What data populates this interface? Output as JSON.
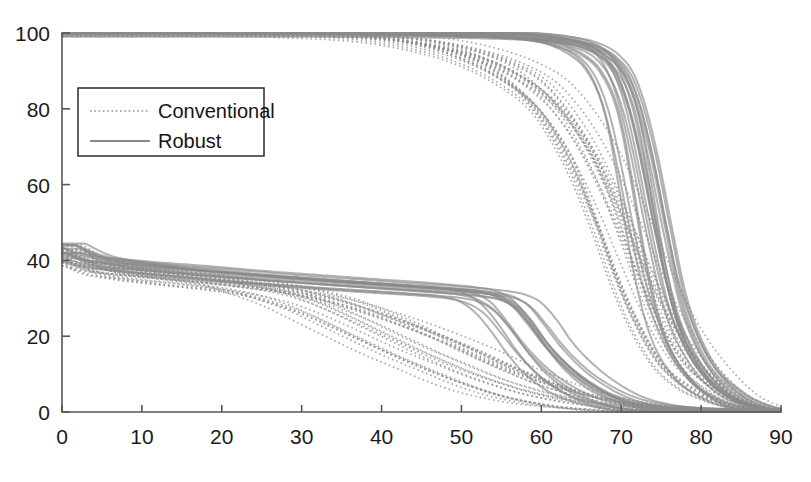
{
  "chart_data": {
    "type": "line",
    "title": "",
    "subtitle": "",
    "xlabel": "",
    "ylabel": "",
    "xlim": [
      0,
      90
    ],
    "ylim": [
      0,
      100
    ],
    "xticks": [
      0,
      10,
      20,
      30,
      40,
      50,
      60,
      70,
      80,
      90
    ],
    "yticks": [
      0,
      20,
      40,
      60,
      80,
      100
    ],
    "xticklabels": [
      "0",
      "10",
      "20",
      "30",
      "40",
      "50",
      "60",
      "70",
      "80",
      "90"
    ],
    "yticklabels": [
      "0",
      "20",
      "40",
      "60",
      "80",
      "100"
    ],
    "grid": false,
    "legend": {
      "position": "upper-left-inside",
      "entries": [
        {
          "label": "Conventional",
          "style": "dotted",
          "color": "#8d8d8d"
        },
        {
          "label": "Robust",
          "style": "solid",
          "color": "#8d8d8d"
        }
      ]
    },
    "series": [
      {
        "name": "Conventional",
        "style": "dotted",
        "color": "#909090",
        "family": "upper",
        "x": [
          0,
          20,
          30,
          35,
          40,
          45,
          50,
          55,
          60,
          62,
          65,
          68,
          70,
          72,
          75,
          78,
          82,
          86,
          90
        ],
        "values": [
          100,
          100,
          99.5,
          99,
          98,
          96,
          93,
          88,
          80,
          74,
          62,
          46,
          34,
          24,
          13,
          7,
          3,
          1,
          0
        ]
      },
      {
        "name": "Conventional",
        "style": "dotted",
        "color": "#909090",
        "family": "upper",
        "x": [
          0,
          20,
          30,
          35,
          40,
          45,
          50,
          55,
          58,
          62,
          65,
          68,
          70,
          73,
          76,
          80,
          84,
          88,
          90
        ],
        "values": [
          100,
          100,
          99.6,
          99.2,
          98.4,
          97,
          94.5,
          90,
          85,
          76,
          66,
          50,
          38,
          24,
          13,
          6,
          2,
          0.5,
          0
        ]
      },
      {
        "name": "Conventional",
        "style": "dotted",
        "color": "#909090",
        "family": "upper",
        "x": [
          0,
          20,
          32,
          38,
          43,
          48,
          52,
          56,
          60,
          64,
          67,
          70,
          72,
          75,
          78,
          82,
          86,
          90
        ],
        "values": [
          100,
          100,
          99.8,
          99,
          98,
          96,
          93,
          89,
          83,
          72,
          60,
          46,
          35,
          21,
          11,
          4,
          1,
          0
        ]
      },
      {
        "name": "Conventional",
        "style": "dotted",
        "color": "#909090",
        "family": "upper",
        "x": [
          0,
          22,
          34,
          40,
          46,
          50,
          54,
          58,
          62,
          66,
          69,
          72,
          75,
          78,
          82,
          86,
          90
        ],
        "values": [
          100,
          100,
          99.5,
          98.5,
          96.5,
          94.5,
          91,
          86,
          78,
          65,
          52,
          37,
          23,
          13,
          5,
          1.5,
          0
        ]
      },
      {
        "name": "Conventional",
        "style": "dotted",
        "color": "#909090",
        "family": "upper",
        "x": [
          0,
          24,
          36,
          42,
          48,
          53,
          57,
          61,
          65,
          68,
          71,
          74,
          77,
          81,
          85,
          90
        ],
        "values": [
          100,
          100,
          99.6,
          99,
          97.5,
          95,
          92,
          87,
          77,
          66,
          52,
          37,
          24,
          12,
          4,
          0
        ]
      },
      {
        "name": "Robust",
        "style": "solid",
        "color": "#8a8a8a",
        "family": "upper",
        "x": [
          0,
          25,
          40,
          50,
          56,
          60,
          63,
          66,
          68,
          70,
          71,
          72,
          74,
          76,
          79,
          83,
          87,
          90
        ],
        "values": [
          100,
          100,
          99.8,
          99.4,
          99,
          98.3,
          97,
          94,
          90,
          81,
          72,
          60,
          36,
          20,
          9,
          3,
          0.5,
          0
        ]
      },
      {
        "name": "Robust",
        "style": "solid",
        "color": "#8a8a8a",
        "family": "upper",
        "x": [
          0,
          25,
          40,
          50,
          57,
          61,
          64,
          67,
          69,
          70.5,
          72,
          73.5,
          75,
          78,
          81,
          85,
          90
        ],
        "values": [
          100,
          100,
          99.7,
          99.2,
          98.6,
          97.8,
          96.4,
          93,
          87,
          78,
          64,
          48,
          34,
          17,
          8,
          2,
          0
        ]
      },
      {
        "name": "Robust",
        "style": "solid",
        "color": "#8a8a8a",
        "family": "upper",
        "x": [
          0,
          26,
          42,
          52,
          58,
          62,
          65,
          67.5,
          69.5,
          71,
          72.5,
          74,
          76,
          79,
          83,
          87,
          90
        ],
        "values": [
          100,
          100,
          99.8,
          99.5,
          99,
          98,
          96.5,
          93.5,
          88,
          79,
          66,
          50,
          30,
          14,
          5,
          1,
          0
        ]
      },
      {
        "name": "Robust",
        "style": "solid",
        "color": "#8a8a8a",
        "family": "upper",
        "x": [
          0,
          27,
          44,
          54,
          60,
          64,
          66.5,
          68.5,
          70,
          71.5,
          73,
          74.5,
          77,
          80,
          84,
          88,
          90
        ],
        "values": [
          100,
          100,
          99.9,
          99.6,
          99.2,
          98.2,
          96.8,
          94,
          89,
          80,
          66,
          50,
          27,
          13,
          4,
          0.8,
          0
        ]
      },
      {
        "name": "Conventional",
        "style": "dotted",
        "color": "#909090",
        "family": "lower",
        "x": [
          0,
          2,
          5,
          10,
          15,
          20,
          24,
          28,
          32,
          36,
          40,
          44,
          48,
          52,
          56,
          60,
          65,
          70,
          75,
          80,
          90
        ],
        "values": [
          41,
          38,
          36.5,
          35,
          34,
          32.5,
          30,
          27,
          23,
          19,
          15,
          11.5,
          8,
          5,
          3,
          1.6,
          0.7,
          0.2,
          0,
          0,
          0
        ]
      },
      {
        "name": "Conventional",
        "style": "dotted",
        "color": "#909090",
        "family": "lower",
        "x": [
          0,
          2,
          6,
          12,
          18,
          24,
          28,
          32,
          36,
          40,
          44,
          48,
          52,
          56,
          60,
          64,
          68,
          72,
          78,
          85,
          90
        ],
        "values": [
          42,
          39,
          37,
          35.5,
          34,
          32,
          29.5,
          26,
          22,
          18,
          14,
          10.5,
          7.5,
          5,
          3.2,
          2,
          1,
          0.4,
          0,
          0,
          0
        ]
      },
      {
        "name": "Conventional",
        "style": "dotted",
        "color": "#909090",
        "family": "lower",
        "x": [
          0,
          3,
          8,
          14,
          20,
          26,
          30,
          34,
          38,
          42,
          46,
          50,
          54,
          58,
          62,
          66,
          70,
          75,
          82,
          90
        ],
        "values": [
          40.5,
          37.5,
          36,
          34.8,
          33.2,
          31,
          28.5,
          25,
          21,
          17,
          13.5,
          10,
          7,
          4.5,
          2.8,
          1.5,
          0.6,
          0.1,
          0,
          0
        ]
      },
      {
        "name": "Conventional",
        "style": "dotted",
        "color": "#909090",
        "family": "lower",
        "x": [
          0,
          3,
          9,
          16,
          22,
          28,
          34,
          38,
          42,
          46,
          50,
          54,
          58,
          62,
          66,
          70,
          74,
          80,
          86,
          90
        ],
        "values": [
          43,
          39.5,
          37,
          35.4,
          34,
          32,
          29,
          26,
          22.5,
          18.5,
          14.5,
          11,
          7.5,
          5,
          3,
          1.6,
          0.7,
          0.1,
          0,
          0
        ]
      },
      {
        "name": "Conventional",
        "style": "dotted",
        "color": "#909090",
        "family": "lower",
        "x": [
          0,
          4,
          10,
          18,
          25,
          31,
          36,
          41,
          46,
          50,
          54,
          58,
          62,
          66,
          70,
          74,
          78,
          84,
          90
        ],
        "values": [
          41.5,
          38,
          36.2,
          34.6,
          33,
          31,
          28,
          24.5,
          20.5,
          17,
          13,
          9.5,
          6.5,
          4,
          2.2,
          1.1,
          0.4,
          0,
          0
        ]
      },
      {
        "name": "Conventional",
        "style": "dotted",
        "color": "#909090",
        "family": "lower",
        "x": [
          0,
          4,
          12,
          20,
          27,
          33,
          38,
          43,
          48,
          52,
          56,
          60,
          64,
          68,
          72,
          76,
          82,
          90
        ],
        "values": [
          42.5,
          39,
          36.5,
          34.5,
          32.5,
          30,
          27,
          23.5,
          19.5,
          16,
          12,
          8.5,
          5.5,
          3.3,
          1.8,
          0.8,
          0.1,
          0
        ]
      },
      {
        "name": "Robust",
        "style": "solid",
        "color": "#8a8a8a",
        "family": "lower",
        "x": [
          0,
          3,
          8,
          15,
          22,
          30,
          36,
          42,
          46,
          50,
          52,
          54,
          56,
          58,
          60,
          63,
          66,
          70,
          74,
          80,
          90
        ],
        "values": [
          43.5,
          40.5,
          38.5,
          37,
          35.6,
          34.3,
          33.4,
          32.6,
          32,
          31.2,
          30,
          27,
          22,
          16,
          11,
          6,
          3.2,
          1.2,
          0.4,
          0,
          0
        ]
      },
      {
        "name": "Robust",
        "style": "solid",
        "color": "#8a8a8a",
        "family": "lower",
        "x": [
          0,
          3,
          9,
          16,
          24,
          32,
          38,
          44,
          48,
          51,
          53,
          55,
          57,
          59,
          62,
          65,
          68,
          72,
          77,
          84,
          90
        ],
        "values": [
          44,
          41,
          39,
          37.2,
          35.8,
          34.5,
          33.6,
          32.8,
          32.2,
          31.4,
          30.2,
          27.5,
          22.5,
          17,
          10.5,
          6,
          3,
          1,
          0.3,
          0,
          0
        ]
      },
      {
        "name": "Robust",
        "style": "solid",
        "color": "#8a8a8a",
        "family": "lower",
        "x": [
          0,
          3,
          10,
          18,
          26,
          34,
          40,
          45,
          49,
          52,
          54,
          56,
          58,
          60,
          63,
          66,
          69,
          73,
          78,
          85,
          90
        ],
        "values": [
          42.8,
          40,
          38.2,
          36.7,
          35.4,
          34.2,
          33.3,
          32.5,
          31.9,
          31.2,
          30.4,
          28,
          23,
          17.5,
          11,
          6.5,
          3.4,
          1.3,
          0.4,
          0,
          0
        ]
      },
      {
        "name": "Robust",
        "style": "solid",
        "color": "#8a8a8a",
        "family": "lower",
        "x": [
          0,
          4,
          11,
          20,
          28,
          36,
          42,
          47,
          51,
          54,
          56,
          58,
          60,
          62,
          65,
          68,
          71,
          75,
          80,
          87,
          90
        ],
        "values": [
          43.2,
          40.2,
          38.4,
          36.9,
          35.5,
          34.3,
          33.4,
          32.7,
          32,
          31.3,
          30.5,
          28.5,
          24,
          18,
          11.5,
          6.8,
          3.5,
          1.4,
          0.4,
          0,
          0
        ]
      }
    ]
  },
  "axes": {
    "x_tick_labels": [
      "0",
      "10",
      "20",
      "30",
      "40",
      "50",
      "60",
      "70",
      "80",
      "90"
    ],
    "y_tick_labels": [
      "0",
      "20",
      "40",
      "60",
      "80",
      "100"
    ]
  },
  "legend": {
    "conventional_label": "Conventional",
    "robust_label": "Robust"
  },
  "colors": {
    "axis": "#575757",
    "curve_conventional": "#909090",
    "curve_robust": "#8a8a8a",
    "text": "#1b1b1b",
    "background": "#ffffff"
  }
}
